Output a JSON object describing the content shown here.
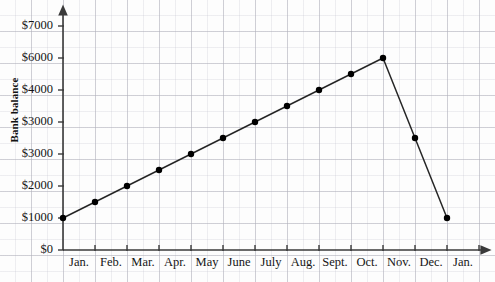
{
  "chart_data": {
    "type": "line",
    "title": "",
    "xlabel": "",
    "ylabel": "Bank balance",
    "categories": [
      "Jan.",
      "Feb.",
      "Mar.",
      "Apr.",
      "May",
      "June",
      "July",
      "Aug.",
      "Sept.",
      "Oct.",
      "Nov.",
      "Dec.",
      "Jan."
    ],
    "values": [
      1000,
      1500,
      2000,
      2500,
      3000,
      3500,
      4000,
      4500,
      5000,
      5500,
      6000,
      3500,
      1000
    ],
    "series": [
      {
        "name": "Bank balance",
        "values": [
          1000,
          1500,
          2000,
          2500,
          3000,
          3500,
          4000,
          4500,
          5000,
          5500,
          6000,
          3500,
          1000
        ]
      }
    ],
    "y_tick_labels": [
      "$7000",
      "$6000",
      "$4000",
      "$3000",
      "$3000",
      "$2000",
      "$1000",
      "$0"
    ],
    "y_tick_values": [
      7000,
      6000,
      5000,
      4000,
      3000,
      2000,
      1000,
      0
    ],
    "ylim": [
      0,
      7000
    ],
    "grid": true,
    "legend": "none",
    "marker": "filled-circle",
    "line_color": "#262626",
    "marker_color": "#000000",
    "grid_color": "#b0b0ba",
    "background_color": "#fdfdfd",
    "annotations": [
      "Y-axis tick labels are evenly spaced but the printed sequence skips $5000 and repeats $3000.",
      "Month labels are centered between the x-axis tick marks.",
      "Balance rises by $500 each month from Jan. to a $6000 peak at Nov., then falls steeply."
    ]
  },
  "axes": {
    "y_title": "Bank balance",
    "y_labels": [
      "$7000",
      "$6000",
      "$4000",
      "$3000",
      "$3000",
      "$2000",
      "$1000",
      "$0"
    ],
    "x_labels": [
      "Jan.",
      "Feb.",
      "Mar.",
      "Apr.",
      "May",
      "June",
      "July",
      "Aug.",
      "Sept.",
      "Oct.",
      "Nov.",
      "Dec.",
      "Jan."
    ]
  }
}
